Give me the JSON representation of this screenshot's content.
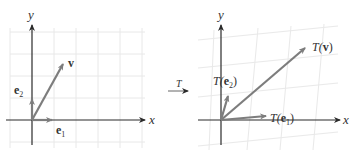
{
  "colors": {
    "axis": "#2b2b2b",
    "vector": "#808080",
    "grid": "#e6e6e6",
    "label": "#333333"
  },
  "left_panel": {
    "x_axis_label": "x",
    "y_axis_label": "y",
    "vectors": [
      {
        "name": "e1",
        "label_main": "e",
        "label_sub": "1"
      },
      {
        "name": "e2",
        "label_main": "e",
        "label_sub": "2"
      },
      {
        "name": "v",
        "label_main": "v"
      }
    ]
  },
  "transform_arrow": {
    "label": "T"
  },
  "right_panel": {
    "x_axis_label": "x",
    "y_axis_label": "y",
    "vectors": [
      {
        "name": "T(e1)",
        "label_prefix": "T(",
        "label_main": "e",
        "label_sub": "1",
        "label_suffix": ")"
      },
      {
        "name": "T(e2)",
        "label_prefix": "T(",
        "label_main": "e",
        "label_sub": "2",
        "label_suffix": ")"
      },
      {
        "name": "T(v)",
        "label_prefix": "T(",
        "label_main": "v",
        "label_suffix": ")"
      }
    ]
  }
}
